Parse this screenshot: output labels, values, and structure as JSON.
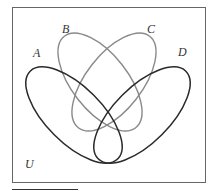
{
  "diagram": {
    "type": "venn",
    "sets": [
      {
        "label": "A",
        "color": "#2a2a2a"
      },
      {
        "label": "B",
        "color": "#8a8a8a"
      },
      {
        "label": "C",
        "color": "#8a8a8a"
      },
      {
        "label": "D",
        "color": "#2a2a2a"
      }
    ],
    "universe_label": "U"
  },
  "colors": {
    "frame": "#555555",
    "background": "#ffffff"
  }
}
